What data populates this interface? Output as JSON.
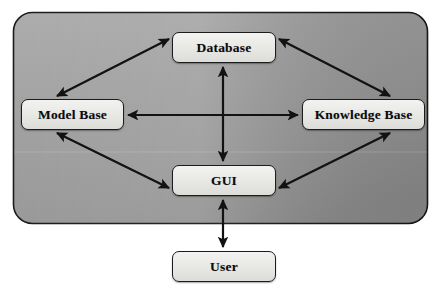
{
  "diagram": {
    "container": {
      "name": "system-boundary",
      "fill_start": "#a2a2a2",
      "fill_end": "#8a8a8a",
      "border": "#1a1a1a",
      "x": 13,
      "y": 12,
      "width": 415,
      "height": 212,
      "radius": 19
    },
    "nodes": [
      {
        "id": "database",
        "label": "Database",
        "x": 172,
        "y": 32,
        "width": 104,
        "height": 31,
        "inside_container": true
      },
      {
        "id": "model-base",
        "label": "Model Base",
        "x": 21,
        "y": 99,
        "width": 103,
        "height": 31,
        "inside_container": true
      },
      {
        "id": "knowledge-base",
        "label": "Knowledge Base",
        "x": 302,
        "y": 99,
        "width": 123,
        "height": 31,
        "inside_container": true
      },
      {
        "id": "gui",
        "label": "GUI",
        "x": 172,
        "y": 165,
        "width": 104,
        "height": 31,
        "inside_container": true
      },
      {
        "id": "user",
        "label": "User",
        "x": 172,
        "y": 251,
        "width": 104,
        "height": 31,
        "inside_container": false
      }
    ],
    "connectors": [
      {
        "id": "model-base--database",
        "from": "model-base",
        "to": "database",
        "kind": "double-headed-arrow",
        "orientation": "diagonal"
      },
      {
        "id": "database--knowledge-base",
        "from": "database",
        "to": "knowledge-base",
        "kind": "double-headed-arrow",
        "orientation": "diagonal"
      },
      {
        "id": "model-base--knowledge-base",
        "from": "model-base",
        "to": "knowledge-base",
        "kind": "double-headed-arrow",
        "orientation": "horizontal"
      },
      {
        "id": "database--gui",
        "from": "database",
        "to": "gui",
        "kind": "double-headed-arrow",
        "orientation": "vertical"
      },
      {
        "id": "model-base--gui",
        "from": "model-base",
        "to": "gui",
        "kind": "double-headed-arrow",
        "orientation": "diagonal"
      },
      {
        "id": "knowledge-base--gui",
        "from": "knowledge-base",
        "to": "gui",
        "kind": "double-headed-arrow",
        "orientation": "diagonal"
      },
      {
        "id": "gui--user",
        "from": "gui",
        "to": "user",
        "kind": "double-headed-arrow",
        "orientation": "vertical"
      }
    ],
    "stroke_color": "#121212",
    "stroke_width": 2.2
  }
}
